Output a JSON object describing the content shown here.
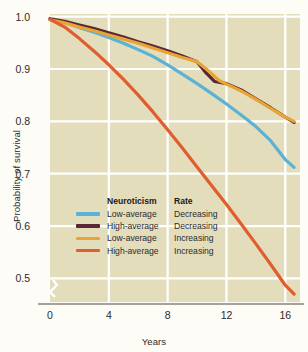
{
  "chart_data": {
    "type": "line",
    "title": "",
    "xlabel": "Years",
    "ylabel": "Probability of survival",
    "xlim": [
      0,
      17
    ],
    "ylim": [
      0.455,
      1.005
    ],
    "xticks": [
      0,
      4,
      8,
      12,
      16
    ],
    "yticks": [
      0.5,
      0.6,
      0.7,
      0.8,
      0.9,
      1.0
    ],
    "ytick_labels": [
      "0.5",
      "0.6",
      "0.7",
      "0.8",
      "0.9",
      "1.0"
    ],
    "xtick_labels": [
      "0",
      "4",
      "8",
      "12",
      "16"
    ],
    "grid": true,
    "axis_break": true,
    "legend_position": "center-left",
    "plot_background": "#e3ddbc",
    "grid_color": "#ffffff",
    "series": [
      {
        "name": "Low-average Decreasing",
        "neuroticism": "Low-average",
        "rate": "Decreasing",
        "color": "#5bb2d5",
        "x": [
          0,
          1,
          2,
          3,
          4,
          5,
          6,
          7,
          8,
          9,
          10,
          11,
          12,
          13,
          14,
          15,
          16,
          16.6
        ],
        "y": [
          0.995,
          0.989,
          0.979,
          0.97,
          0.96,
          0.949,
          0.937,
          0.924,
          0.908,
          0.89,
          0.872,
          0.853,
          0.833,
          0.812,
          0.79,
          0.763,
          0.727,
          0.712
        ]
      },
      {
        "name": "High-average Decreasing",
        "neuroticism": "High-average",
        "rate": "Decreasing",
        "color": "#5d2636",
        "x": [
          0,
          1,
          2,
          3,
          4,
          5,
          6,
          7,
          8,
          9,
          10,
          10.6,
          11.2,
          12,
          13,
          14,
          15,
          16,
          16.6
        ],
        "y": [
          0.996,
          0.991,
          0.984,
          0.977,
          0.969,
          0.961,
          0.952,
          0.944,
          0.935,
          0.925,
          0.914,
          0.893,
          0.876,
          0.872,
          0.86,
          0.843,
          0.826,
          0.808,
          0.798
        ]
      },
      {
        "name": "Low-average Increasing",
        "neuroticism": "Low-average",
        "rate": "Increasing",
        "color": "#e8a435",
        "x": [
          0,
          1,
          2,
          3,
          4,
          5,
          6,
          7,
          8,
          9,
          10,
          10.8,
          11.5,
          12,
          13,
          14,
          15,
          16,
          16.6
        ],
        "y": [
          0.994,
          0.988,
          0.98,
          0.973,
          0.965,
          0.957,
          0.949,
          0.94,
          0.931,
          0.922,
          0.914,
          0.896,
          0.878,
          0.871,
          0.858,
          0.842,
          0.825,
          0.808,
          0.8
        ]
      },
      {
        "name": "High-average Increasing",
        "neuroticism": "High-average",
        "rate": "Increasing",
        "color": "#e05d2f",
        "x": [
          0,
          1,
          2,
          3,
          4,
          5,
          6,
          7,
          8,
          9,
          10,
          11,
          12,
          13,
          14,
          15,
          16,
          16.6
        ],
        "y": [
          0.995,
          0.98,
          0.958,
          0.934,
          0.908,
          0.88,
          0.85,
          0.818,
          0.784,
          0.749,
          0.713,
          0.677,
          0.641,
          0.604,
          0.566,
          0.527,
          0.487,
          0.47
        ]
      }
    ]
  },
  "legend": {
    "header_col1": "Neuroticism",
    "header_col2": "Rate",
    "rows": [
      {
        "color": "#5bb2d5",
        "neuroticism": "Low-average",
        "rate": "Decreasing"
      },
      {
        "color": "#5d2636",
        "neuroticism": "High-average",
        "rate": "Decreasing"
      },
      {
        "color": "#e8a435",
        "neuroticism": "Low-average",
        "rate": "Increasing"
      },
      {
        "color": "#e05d2f",
        "neuroticism": "High-average",
        "rate": "Increasing"
      }
    ]
  }
}
